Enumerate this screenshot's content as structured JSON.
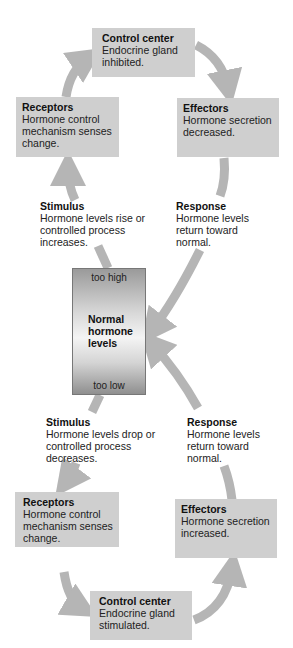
{
  "colors": {
    "box": "#cfcfcf",
    "arrow": "#b5b5b5",
    "text": "#222222"
  },
  "top_loop": {
    "control_center": {
      "title": "Control center",
      "body": "Endocrine gland inhibited."
    },
    "receptors": {
      "title": "Receptors",
      "body": "Hormone control mechanism senses change."
    },
    "effectors": {
      "title": "Effectors",
      "body": "Hormone secretion decreased."
    },
    "stimulus": {
      "title": "Stimulus",
      "body": "Hormone levels rise or controlled process increases."
    },
    "response": {
      "title": "Response",
      "body": "Hormone levels return toward normal."
    }
  },
  "center": {
    "high": "too high",
    "title": "Normal hormone levels",
    "low": "too low"
  },
  "bottom_loop": {
    "stimulus": {
      "title": "Stimulus",
      "body": "Hormone levels drop or controlled process decreases."
    },
    "response": {
      "title": "Response",
      "body": "Hormone levels return toward normal."
    },
    "receptors": {
      "title": "Receptors",
      "body": "Hormone control mechanism senses change."
    },
    "effectors": {
      "title": "Effectors",
      "body": "Hormone secretion increased."
    },
    "control_center": {
      "title": "Control center",
      "body": "Endocrine gland stimulated."
    }
  }
}
